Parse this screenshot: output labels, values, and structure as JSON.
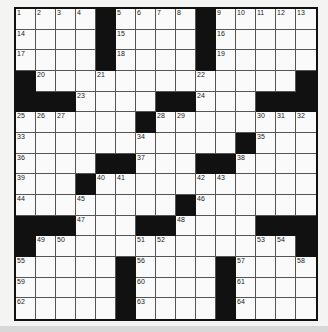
{
  "puzzle": {
    "rows": 15,
    "cols": 15,
    "grid": [
      [
        "1",
        "2",
        "3",
        "4",
        "#",
        "5",
        "6",
        "7",
        "8",
        "#",
        "9",
        "10",
        "11",
        "12",
        "13"
      ],
      [
        "14",
        "",
        "",
        "",
        "#",
        "15",
        "",
        "",
        "",
        "#",
        "16",
        "",
        "",
        "",
        ""
      ],
      [
        "17",
        "",
        "",
        "",
        "#",
        "18",
        "",
        "",
        "",
        "#",
        "19",
        "",
        "",
        "",
        ""
      ],
      [
        "#",
        "20",
        "",
        "",
        "21",
        "",
        "",
        "",
        "",
        "22",
        "",
        "",
        "",
        "",
        "#"
      ],
      [
        "#",
        "#",
        "#",
        "23",
        "",
        "",
        "",
        "#",
        "#",
        "24",
        "",
        "",
        "#",
        "#",
        "#"
      ],
      [
        "25",
        "26",
        "27",
        "",
        "",
        "",
        "#",
        "28",
        "29",
        "",
        "",
        "",
        "30",
        "31",
        "32"
      ],
      [
        "33",
        "",
        "",
        "",
        "",
        "",
        "34",
        "",
        "",
        "",
        "",
        "#",
        "35",
        "",
        ""
      ],
      [
        "36",
        "",
        "",
        "",
        "#",
        "#",
        "37",
        "",
        "",
        "#",
        "#",
        "38",
        "",
        "",
        ""
      ],
      [
        "39",
        "",
        "",
        "#",
        "40",
        "41",
        "",
        "",
        "",
        "42",
        "43",
        "",
        "",
        "",
        ""
      ],
      [
        "44",
        "",
        "",
        "45",
        "",
        "",
        "",
        "",
        "#",
        "46",
        "",
        "",
        "",
        "",
        ""
      ],
      [
        "#",
        "#",
        "#",
        "47",
        "",
        "",
        "#",
        "#",
        "48",
        "",
        "",
        "",
        "#",
        "#",
        "#"
      ],
      [
        "#",
        "49",
        "50",
        "",
        "",
        "",
        "51",
        "52",
        "",
        "",
        "",
        "",
        "53",
        "54",
        "#"
      ],
      [
        "55",
        "",
        "",
        "",
        "",
        "#",
        "56",
        "",
        "",
        "",
        "#",
        "57",
        "",
        "",
        "58"
      ],
      [
        "59",
        "",
        "",
        "",
        "",
        "#",
        "60",
        "",
        "",
        "",
        "#",
        "61",
        "",
        "",
        ""
      ],
      [
        "62",
        "",
        "",
        "",
        "",
        "#",
        "63",
        "",
        "",
        "",
        "#",
        "64",
        "",
        "",
        ""
      ]
    ]
  }
}
